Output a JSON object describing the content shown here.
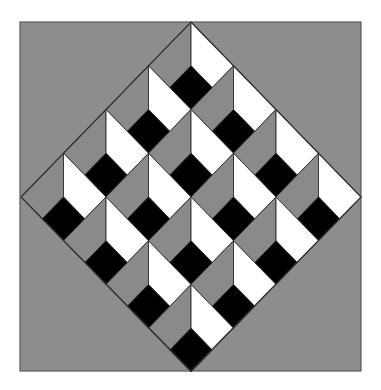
{
  "colors": {
    "page_background": "#ffffff",
    "square_fill": "#8d8d8d",
    "square_border": "#5a5a5a",
    "left_face": "#8a8a8a",
    "right_face": "#ffffff",
    "bottom_face": "#000000",
    "line": "#2e2e2e"
  },
  "square": {
    "x": 20,
    "y": 22,
    "width": 341,
    "height": 349
  },
  "diamond": {
    "top": [
      191,
      22
    ],
    "right": [
      361,
      197
    ],
    "bottom": [
      191,
      371
    ],
    "left": [
      21,
      197
    ]
  },
  "grid": {
    "rows": 4,
    "cols": 4
  }
}
